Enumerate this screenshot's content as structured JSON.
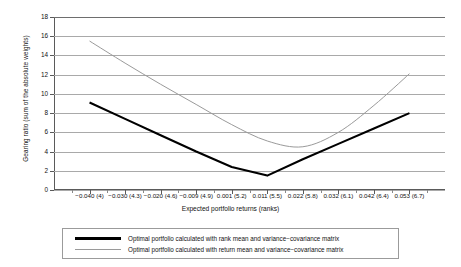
{
  "chart_data": {
    "type": "line",
    "title": "",
    "xlabel": "Expected portfolio returns (ranks)",
    "ylabel": "Gearing ratio (sum of the absolute weights)",
    "ylim": [
      0,
      18
    ],
    "yticks": [
      0,
      2,
      4,
      6,
      8,
      10,
      12,
      14,
      16,
      18
    ],
    "grid": true,
    "legend_position": "bottom",
    "categories": [
      "-0.040 (4)",
      "-0.030 (4.3)",
      "-0.020 (4.6)",
      "-0.009 (4.9)",
      "0.001 (5.2)",
      "0.011 (5.5)",
      "0.022 (5.8)",
      "0.032 (6.1)",
      "0.042 (6.4)",
      "0.053 (6.7)"
    ],
    "series": [
      {
        "name": "Optimal portfolio calculated with rank mean and variance−covariance matrix",
        "color": "#000000",
        "width": "thick",
        "values": [
          9.1,
          7.4,
          5.7,
          4.0,
          2.4,
          1.5,
          3.2,
          4.8,
          6.4,
          8.0
        ]
      },
      {
        "name": "Optimal portfolio calculated with return mean and variance−covariance matrix",
        "color": "#9a9a9a",
        "width": "thin",
        "values": [
          15.5,
          13.2,
          11.0,
          8.9,
          6.8,
          5.1,
          4.5,
          6.0,
          8.8,
          12.1
        ]
      }
    ]
  },
  "axes": {
    "y": {
      "title": "Gearing ratio (sum of the absolute weights)",
      "ticks": [
        "0",
        "2",
        "4",
        "6",
        "8",
        "10",
        "12",
        "14",
        "16",
        "18"
      ]
    },
    "x": {
      "title": "Expected portfolio returns (ranks)",
      "ticks": [
        "−0.040 (4)",
        "−0.030 (4.3)",
        "−0.020 (4.6)",
        "−0.009 (4.9)",
        "0.001 (5.2)",
        "0.011 (5.5)",
        "0.022 (5.8)",
        "0.032 (6.1)",
        "0.042 (6.4)",
        "0.053 (6.7)"
      ]
    }
  },
  "legend": {
    "entries": [
      {
        "label": "Optimal portfolio calculated with rank mean and variance−covariance matrix",
        "style": "thick-black"
      },
      {
        "label": "Optimal portfolio calculated with return mean and variance−covariance matrix",
        "style": "thin-gray"
      }
    ]
  }
}
